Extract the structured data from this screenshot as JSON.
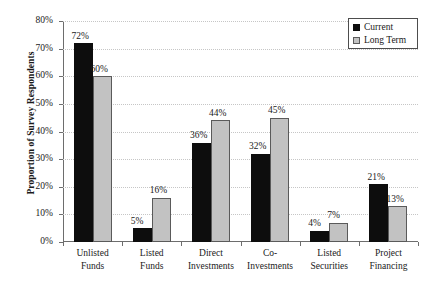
{
  "chart_data": {
    "type": "bar",
    "title": "",
    "subtitle": "",
    "xlabel": "",
    "ylabel": "Proportion of Survey Respondents",
    "ylim": [
      0,
      80
    ],
    "ytick_labels": [
      "0%",
      "10%",
      "20%",
      "30%",
      "40%",
      "50%",
      "60%",
      "70%",
      "80%"
    ],
    "ytick_values": [
      0,
      10,
      20,
      30,
      40,
      50,
      60,
      70,
      80
    ],
    "grid": true,
    "legend_position": "top-right",
    "categories": [
      "Unlisted Funds",
      "Listed Funds",
      "Direct Investments",
      "Co-Investments",
      "Listed Securities",
      "Project Financing"
    ],
    "category_lines": [
      [
        "Unlisted",
        "Funds"
      ],
      [
        "Listed",
        "Funds"
      ],
      [
        "Direct",
        "Investments"
      ],
      [
        "Co-",
        "Investments"
      ],
      [
        "Listed",
        "Securities"
      ],
      [
        "Project",
        "Financing"
      ]
    ],
    "series": [
      {
        "name": "Current",
        "color": "#0d0d0d",
        "values": [
          72,
          5,
          36,
          32,
          4,
          21
        ],
        "data_labels": [
          "72%",
          "5%",
          "36%",
          "32%",
          "4%",
          "21%"
        ]
      },
      {
        "name": "Long Term",
        "color": "#c2c2c2",
        "values": [
          60,
          16,
          44,
          45,
          7,
          13
        ],
        "data_labels": [
          "60%",
          "16%",
          "44%",
          "45%",
          "7%",
          "13%"
        ]
      }
    ]
  },
  "legend": {
    "items": [
      {
        "label": "Current",
        "swatch": "black-square-icon"
      },
      {
        "label": "Long Term",
        "swatch": "gray-square-icon"
      }
    ]
  }
}
